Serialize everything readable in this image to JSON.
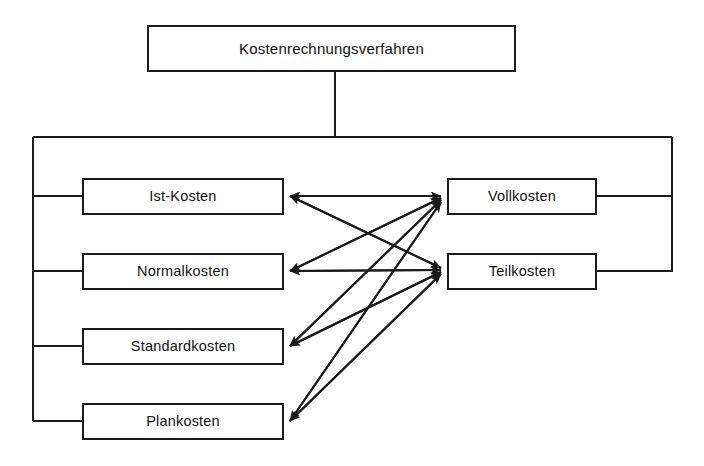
{
  "diagram": {
    "title_node": {
      "id": "kostenrechnungsverfahren",
      "label": "Kostenrechnungsverfahren"
    },
    "groups": {
      "time_reference_label": "",
      "scope_label": ""
    },
    "left_column": [
      {
        "id": "ist-kosten",
        "label": "Ist-Kosten"
      },
      {
        "id": "normalkosten",
        "label": "Normalkosten"
      },
      {
        "id": "standardkosten",
        "label": "Standardkosten"
      },
      {
        "id": "plankosten",
        "label": "Plankosten"
      }
    ],
    "right_column": [
      {
        "id": "vollkosten",
        "label": "Vollkosten"
      },
      {
        "id": "teilkosten",
        "label": "Teilkosten"
      }
    ],
    "colors": {
      "line": "#1a1a1a",
      "box_border": "#1a1a1a",
      "box_fill": "#ffffff",
      "text": "#111111",
      "background": "#ffffff"
    }
  }
}
